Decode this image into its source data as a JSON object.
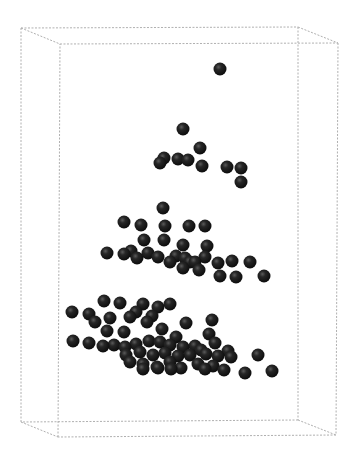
{
  "chart_data": {
    "type": "scatter",
    "title": "",
    "xlabel": "",
    "ylabel": "",
    "zlabel": "",
    "projection": "3d",
    "grid": false,
    "legend": null,
    "box": {
      "style": "dotted",
      "color": "#b0b0b0",
      "back": {
        "tl": [
          21,
          28
        ],
        "tr": [
          298,
          27
        ],
        "br": [
          298,
          420
        ],
        "bl": [
          21,
          422
        ]
      },
      "front": {
        "tl": [
          60,
          44
        ],
        "tr": [
          338,
          43
        ],
        "br": [
          336,
          435
        ],
        "bl": [
          58,
          437
        ]
      }
    },
    "marker": {
      "shape": "sphere",
      "color": "#1a1a1a",
      "radius": 6.5
    },
    "points_screen_xy": [
      [
        220,
        69
      ],
      [
        183,
        129
      ],
      [
        200,
        148
      ],
      [
        164,
        158
      ],
      [
        160,
        163
      ],
      [
        178,
        159
      ],
      [
        188,
        160
      ],
      [
        202,
        166
      ],
      [
        227,
        167
      ],
      [
        241,
        168
      ],
      [
        241,
        182
      ],
      [
        163,
        208
      ],
      [
        124,
        222
      ],
      [
        141,
        225
      ],
      [
        165,
        226
      ],
      [
        189,
        226
      ],
      [
        205,
        226
      ],
      [
        144,
        240
      ],
      [
        164,
        240
      ],
      [
        183,
        245
      ],
      [
        207,
        246
      ],
      [
        107,
        253
      ],
      [
        124,
        254
      ],
      [
        131,
        251
      ],
      [
        137,
        258
      ],
      [
        148,
        253
      ],
      [
        158,
        257
      ],
      [
        170,
        262
      ],
      [
        176,
        256
      ],
      [
        185,
        258
      ],
      [
        190,
        262
      ],
      [
        195,
        262
      ],
      [
        205,
        257
      ],
      [
        218,
        263
      ],
      [
        232,
        261
      ],
      [
        250,
        262
      ],
      [
        183,
        268
      ],
      [
        199,
        270
      ],
      [
        220,
        276
      ],
      [
        236,
        277
      ],
      [
        264,
        276
      ],
      [
        104,
        301
      ],
      [
        120,
        303
      ],
      [
        143,
        304
      ],
      [
        170,
        304
      ],
      [
        72,
        312
      ],
      [
        89,
        314
      ],
      [
        110,
        318
      ],
      [
        130,
        317
      ],
      [
        136,
        312
      ],
      [
        152,
        316
      ],
      [
        158,
        307
      ],
      [
        186,
        323
      ],
      [
        212,
        320
      ],
      [
        95,
        322
      ],
      [
        147,
        322
      ],
      [
        107,
        331
      ],
      [
        124,
        332
      ],
      [
        162,
        329
      ],
      [
        176,
        337
      ],
      [
        209,
        334
      ],
      [
        73,
        341
      ],
      [
        89,
        343
      ],
      [
        103,
        346
      ],
      [
        114,
        345
      ],
      [
        125,
        347
      ],
      [
        136,
        344
      ],
      [
        149,
        341
      ],
      [
        160,
        342
      ],
      [
        170,
        345
      ],
      [
        183,
        347
      ],
      [
        195,
        346
      ],
      [
        215,
        343
      ],
      [
        228,
        351
      ],
      [
        126,
        355
      ],
      [
        140,
        352
      ],
      [
        153,
        355
      ],
      [
        165,
        353
      ],
      [
        178,
        356
      ],
      [
        190,
        355
      ],
      [
        201,
        350
      ],
      [
        206,
        354
      ],
      [
        218,
        356
      ],
      [
        231,
        357
      ],
      [
        130,
        362
      ],
      [
        143,
        364
      ],
      [
        157,
        367
      ],
      [
        170,
        362
      ],
      [
        181,
        368
      ],
      [
        198,
        364
      ],
      [
        213,
        366
      ],
      [
        143,
        369
      ],
      [
        158,
        368
      ],
      [
        171,
        369
      ],
      [
        205,
        369
      ],
      [
        224,
        370
      ],
      [
        245,
        373
      ],
      [
        258,
        355
      ],
      [
        272,
        371
      ]
    ]
  },
  "header": {
    "cut_off_text": "· ·"
  }
}
